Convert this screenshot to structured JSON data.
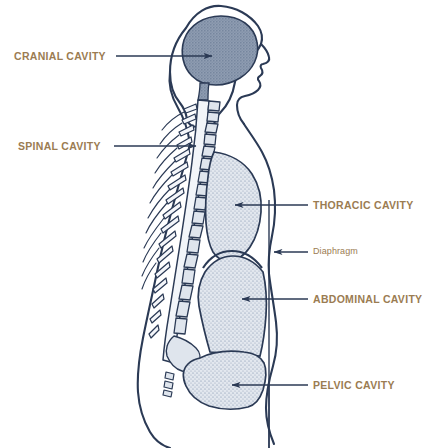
{
  "diagram": {
    "background_color": "#ffffff",
    "label_color": "#9b7c52",
    "leader_color": "#2b3a55",
    "outline_color": "#2b3a55",
    "cavity_fill_color": "#ced6e0",
    "cranial_fill_color": "#8d9bb0"
  },
  "labels": {
    "cranial": "CRANIAL CAVITY",
    "spinal": "SPINAL CAVITY",
    "thoracic": "THORACIC CAVITY",
    "diaphragm": "Diaphragm",
    "abdominal": "ABDOMINAL CAVITY",
    "pelvic": "PELVIC CAVITY"
  }
}
